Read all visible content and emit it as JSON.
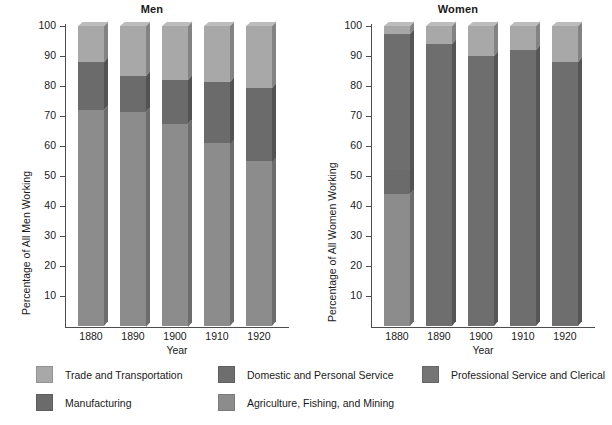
{
  "figure": {
    "width": 612,
    "height": 425,
    "background": "#ffffff"
  },
  "chart_data": {
    "type": "bar",
    "subtype": "stacked-bar-3d",
    "title": "",
    "panels": [
      {
        "title": "Men",
        "xlabel": "Year",
        "ylabel": "Percentage of All Men Working",
        "categories": [
          "1880",
          "1890",
          "1900",
          "1910",
          "1920"
        ],
        "ylim": [
          0,
          100
        ],
        "yticks": [
          10,
          20,
          30,
          40,
          50,
          60,
          70,
          80,
          90,
          100
        ],
        "grid": false,
        "series": [
          {
            "name": "Agriculture, Fishing, and Mining",
            "values": [
              72,
              71.5,
              67.5,
              61,
              55
            ]
          },
          {
            "name": "Manufacturing",
            "values": [
              16,
              12,
              14.5,
              20.5,
              24.5
            ]
          },
          {
            "name": "Trade and Transportation",
            "values": [
              12,
              16.5,
              18,
              18.5,
              20.5
            ]
          },
          {
            "name": "Domestic and Personal Service",
            "values": [
              0,
              0,
              0,
              0,
              0
            ]
          },
          {
            "name": "Professional Service and Clerical",
            "values": [
              0,
              0,
              0,
              0,
              0
            ]
          }
        ],
        "segment_tops": [
          [
            72,
            88,
            100
          ],
          [
            71.5,
            83.5,
            100
          ],
          [
            67.5,
            82,
            100
          ],
          [
            61,
            81.5,
            100
          ],
          [
            55,
            79.5,
            100
          ]
        ]
      },
      {
        "title": "Women",
        "xlabel": "Year",
        "ylabel": "Percentage of All Women Working",
        "categories": [
          "1880",
          "1890",
          "1900",
          "1910",
          "1920"
        ],
        "ylim": [
          0,
          100
        ],
        "yticks": [
          10,
          20,
          30,
          40,
          50,
          60,
          70,
          80,
          90,
          100
        ],
        "grid": false,
        "series": [
          {
            "name": "Agriculture, Fishing, and Mining",
            "values": [
              44,
              0,
              0,
              0,
              0
            ]
          },
          {
            "name": "Manufacturing",
            "values": [
              8,
              0,
              0,
              0,
              0
            ]
          },
          {
            "name": "Domestic and Personal Service",
            "values": [
              45,
              94,
              90,
              92,
              88
            ]
          },
          {
            "name": "Professional Service and Clerical",
            "values": [
              0,
              0,
              0,
              0,
              0
            ]
          },
          {
            "name": "Trade and Transportation",
            "values": [
              3,
              6,
              10,
              8,
              12
            ]
          }
        ],
        "segment_tops": [
          [
            44,
            52,
            97.5,
            100
          ],
          [
            94,
            100
          ],
          [
            90,
            100
          ],
          [
            92,
            100
          ],
          [
            88,
            100
          ]
        ]
      }
    ],
    "legend": {
      "position": "bottom",
      "entries": [
        {
          "label": "Trade and Transportation",
          "color": "#a8a8a8"
        },
        {
          "label": "Domestic and Personal Service",
          "color": "#6e6e6e"
        },
        {
          "label": "Professional Service and Clerical",
          "color": "#757575"
        },
        {
          "label": "Manufacturing",
          "color": "#6b6b6b"
        },
        {
          "label": "Agriculture, Fishing, and Mining",
          "color": "#8c8c8c"
        }
      ]
    },
    "colors": {
      "trade_transportation": "#a8a8a8",
      "domestic_personal_service": "#6e6e6e",
      "professional_clerical": "#757575",
      "manufacturing": "#6b6b6b",
      "agriculture_fishing_mining": "#8c8c8c",
      "axis": "#4d4d4d",
      "text": "#1a1a1a"
    }
  }
}
